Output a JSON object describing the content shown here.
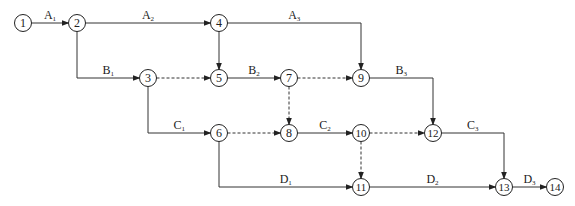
{
  "diagram": {
    "type": "activity-on-arrow network",
    "nodes": [
      "1",
      "2",
      "3",
      "4",
      "5",
      "6",
      "7",
      "8",
      "9",
      "10",
      "11",
      "12",
      "13",
      "14"
    ],
    "edges": [
      {
        "from": "1",
        "to": "2",
        "label": "A",
        "sub": "1",
        "dashed": false
      },
      {
        "from": "2",
        "to": "4",
        "label": "A",
        "sub": "2",
        "dashed": false
      },
      {
        "from": "4",
        "to": "9",
        "label": "A",
        "sub": "3",
        "dashed": false
      },
      {
        "from": "2",
        "to": "3",
        "label": "B",
        "sub": "1",
        "dashed": false
      },
      {
        "from": "3",
        "to": "5",
        "label": "",
        "sub": "",
        "dashed": true
      },
      {
        "from": "4",
        "to": "5",
        "label": "",
        "sub": "",
        "dashed": false
      },
      {
        "from": "5",
        "to": "7",
        "label": "B",
        "sub": "2",
        "dashed": false
      },
      {
        "from": "7",
        "to": "9",
        "label": "",
        "sub": "",
        "dashed": true
      },
      {
        "from": "7",
        "to": "8",
        "label": "",
        "sub": "",
        "dashed": true
      },
      {
        "from": "9",
        "to": "12",
        "label": "B",
        "sub": "3",
        "dashed": false
      },
      {
        "from": "3",
        "to": "6",
        "label": "C",
        "sub": "1",
        "dashed": false
      },
      {
        "from": "6",
        "to": "8",
        "label": "",
        "sub": "",
        "dashed": true
      },
      {
        "from": "8",
        "to": "10",
        "label": "C",
        "sub": "2",
        "dashed": false
      },
      {
        "from": "10",
        "to": "12",
        "label": "",
        "sub": "",
        "dashed": true
      },
      {
        "from": "10",
        "to": "11",
        "label": "",
        "sub": "",
        "dashed": true
      },
      {
        "from": "12",
        "to": "13",
        "label": "C",
        "sub": "3",
        "dashed": false
      },
      {
        "from": "6",
        "to": "11",
        "label": "D",
        "sub": "1",
        "dashed": false
      },
      {
        "from": "11",
        "to": "13",
        "label": "D",
        "sub": "2",
        "dashed": false
      },
      {
        "from": "13",
        "to": "14",
        "label": "D",
        "sub": "3",
        "dashed": false
      }
    ]
  }
}
